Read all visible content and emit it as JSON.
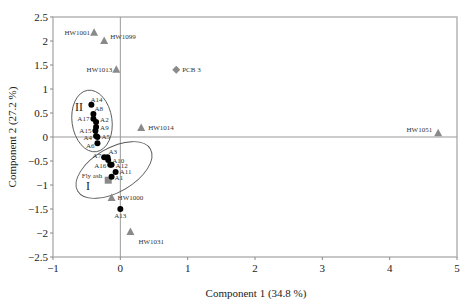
{
  "chart_data": {
    "type": "scatter",
    "title": "",
    "xlabel": "Component 1  (34.8 %)",
    "ylabel": "Component 2  (27.2 %)",
    "xlim": [
      -1,
      5
    ],
    "ylim": [
      -2.5,
      2.5
    ],
    "xticks": [
      -1,
      0,
      1,
      2,
      3,
      4,
      5
    ],
    "yticks": [
      2.5,
      2,
      1.5,
      1,
      0.5,
      0,
      -0.5,
      -1,
      -1.5,
      -2,
      -2.5
    ],
    "grid": false,
    "legend": null,
    "series": [
      {
        "name": "HW samples",
        "marker": "triangle",
        "color": "#8a8a8a",
        "points": [
          {
            "label": "HW1001",
            "x": -0.39,
            "y": 2.17
          },
          {
            "label": "HW1099",
            "x": -0.24,
            "y": 2.0
          },
          {
            "label": "HW1013",
            "x": -0.06,
            "y": 1.4
          },
          {
            "label": "HW1014",
            "x": 0.31,
            "y": 0.19
          },
          {
            "label": "HW1051",
            "x": 4.72,
            "y": 0.08
          },
          {
            "label": "HW1000",
            "x": -0.13,
            "y": -1.27
          },
          {
            "label": "HW1031",
            "x": 0.15,
            "y": -1.98
          }
        ]
      },
      {
        "name": "PCB",
        "marker": "diamond",
        "color": "#8a8a8a",
        "points": [
          {
            "label": "PCB 3",
            "x": 0.83,
            "y": 1.4
          }
        ]
      },
      {
        "name": "Fly ash",
        "marker": "square",
        "color": "#8a8a8a",
        "points": [
          {
            "label": "Fly ash",
            "x": -0.18,
            "y": -0.9
          }
        ]
      },
      {
        "name": "A samples",
        "marker": "circle",
        "color": "#000000",
        "points": [
          {
            "label": "A14",
            "x": -0.43,
            "y": 0.67
          },
          {
            "label": "A8",
            "x": -0.4,
            "y": 0.48
          },
          {
            "label": "A17",
            "x": -0.4,
            "y": 0.38
          },
          {
            "label": "A2",
            "x": -0.36,
            "y": 0.31
          },
          {
            "label": "A9",
            "x": -0.36,
            "y": 0.21
          },
          {
            "label": "A15",
            "x": -0.37,
            "y": 0.13
          },
          {
            "label": "A4",
            "x": -0.36,
            "y": 0.02
          },
          {
            "label": "A5",
            "x": -0.34,
            "y": 0.0
          },
          {
            "label": "A6",
            "x": -0.34,
            "y": -0.13
          },
          {
            "label": "A7",
            "x": -0.24,
            "y": -0.42
          },
          {
            "label": "A3",
            "x": -0.19,
            "y": -0.42
          },
          {
            "label": "A10",
            "x": -0.18,
            "y": -0.48
          },
          {
            "label": "A16",
            "x": -0.15,
            "y": -0.58
          },
          {
            "label": "A12",
            "x": -0.13,
            "y": -0.58
          },
          {
            "label": "A11",
            "x": -0.07,
            "y": -0.73
          },
          {
            "label": "A1",
            "x": -0.13,
            "y": -0.83
          },
          {
            "label": "A13",
            "x": 0.0,
            "y": -1.5
          }
        ]
      }
    ],
    "annotations": [
      {
        "text": "II",
        "type": "cluster-ellipse",
        "center": [
          -0.41,
          0.33
        ]
      },
      {
        "text": "I",
        "type": "cluster-ellipse",
        "center": [
          -0.2,
          -0.7
        ]
      }
    ]
  }
}
